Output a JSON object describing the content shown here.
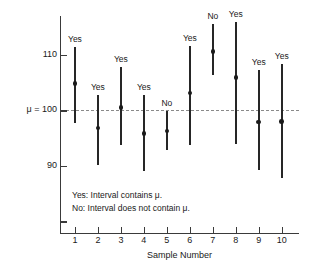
{
  "chart_data": {
    "type": "line",
    "title": "",
    "xlabel": "Sample Number",
    "ylabel": "",
    "x": [
      1,
      2,
      3,
      4,
      5,
      6,
      7,
      8,
      9,
      10
    ],
    "xtick_labels": [
      "1",
      "2",
      "3",
      "4",
      "5",
      "6",
      "7",
      "8",
      "9",
      "10"
    ],
    "ytick_labels": [
      "110",
      "μ = 100",
      "90"
    ],
    "ytick_values": [
      110,
      100,
      90
    ],
    "ylim": [
      78,
      117
    ],
    "xlim": [
      0.35,
      10.75
    ],
    "grid": false,
    "reference_line": {
      "label": "μ = 100",
      "value": 100,
      "style": "dashed"
    },
    "series": [
      {
        "name": "Confidence intervals",
        "points": [
          {
            "sample": 1,
            "center": 104.8,
            "lower": 97.7,
            "upper": 111.4,
            "label": "Yes"
          },
          {
            "sample": 2,
            "center": 96.8,
            "lower": 90.2,
            "upper": 102.8,
            "label": "Yes"
          },
          {
            "sample": 3,
            "center": 100.5,
            "lower": 93.7,
            "upper": 107.8,
            "label": "Yes"
          },
          {
            "sample": 4,
            "center": 95.8,
            "lower": 89.0,
            "upper": 102.7,
            "label": "Yes"
          },
          {
            "sample": 5,
            "center": 96.3,
            "lower": 92.8,
            "upper": 99.9,
            "label": "No"
          },
          {
            "sample": 6,
            "center": 103.1,
            "lower": 93.8,
            "upper": 111.6,
            "label": "Yes"
          },
          {
            "sample": 7,
            "center": 110.6,
            "lower": 106.4,
            "upper": 115.6,
            "label": "No"
          },
          {
            "sample": 8,
            "center": 105.9,
            "lower": 93.9,
            "upper": 116.0,
            "label": "Yes"
          },
          {
            "sample": 9,
            "center": 97.9,
            "lower": 89.3,
            "upper": 107.3,
            "label": "Yes"
          },
          {
            "sample": 10,
            "center": 98.0,
            "lower": 87.9,
            "upper": 108.4,
            "label": "Yes"
          }
        ]
      }
    ],
    "annotations": [
      "Yes: Interval contains μ.",
      "No: Interval does not contain μ."
    ]
  },
  "legend": {
    "yes_text": "Yes: Interval contains μ.",
    "no_text": "No: Interval does not contain μ."
  },
  "colors": {
    "interval": "#262626",
    "axis": "#3a3a3a",
    "reference_line": "#8a8a8a",
    "background": "#ffffff"
  }
}
